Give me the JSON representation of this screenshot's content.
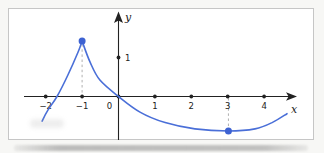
{
  "colors": {
    "curve": "#4a6fd8",
    "point": "#3d62d2",
    "axis": "#222222",
    "dashed_guide": "#b0b0b0",
    "frame_border": "#c6c6c6",
    "background": "#ffffff"
  },
  "chart_data": {
    "type": "line",
    "title": "",
    "xlabel": "x",
    "ylabel": "y",
    "xlim": [
      -2.6,
      4.9
    ],
    "ylim": [
      -1.2,
      2.2
    ],
    "grid": false,
    "legend": false,
    "x_ticks": [
      -2,
      -1,
      0,
      1,
      2,
      3,
      4
    ],
    "x_tick_labels": [
      "−2",
      "−1",
      "0",
      "1",
      "2",
      "3",
      "4"
    ],
    "y_unit_mark": {
      "value": 1,
      "label": "1"
    },
    "series": [
      {
        "name": "left-branch",
        "points": [
          [
            -2.1,
            -0.63
          ],
          [
            -1.94,
            -0.35
          ],
          [
            -1.69,
            0
          ],
          [
            -1.39,
            0.55
          ],
          [
            -1.11,
            1.14
          ],
          [
            -1,
            1.42
          ]
        ]
      },
      {
        "name": "right-branch",
        "points": [
          [
            -1,
            1.42
          ],
          [
            -0.78,
            0.88
          ],
          [
            -0.51,
            0.42
          ],
          [
            0,
            0
          ],
          [
            0.59,
            -0.4
          ],
          [
            1.28,
            -0.67
          ],
          [
            2.1,
            -0.83
          ],
          [
            3.02,
            -0.885
          ],
          [
            3.75,
            -0.83
          ],
          [
            4.22,
            -0.67
          ],
          [
            4.63,
            -0.44
          ]
        ]
      }
    ],
    "annotations": [
      {
        "type": "point",
        "name": "local-max-point",
        "xy": [
          -1,
          1.42
        ],
        "style": "filled-blue"
      },
      {
        "type": "point",
        "name": "local-min-point",
        "xy": [
          3.02,
          -0.885
        ],
        "style": "filled-blue"
      },
      {
        "type": "point",
        "name": "y-unit-point",
        "xy": [
          0,
          1
        ],
        "style": "filled-black",
        "label": "1"
      }
    ],
    "dashed_guides": [
      {
        "name": "guide-x-neg1",
        "from": [
          -1,
          0.1
        ],
        "to": [
          -1,
          1.32
        ]
      },
      {
        "name": "guide-x-3",
        "from": [
          3.02,
          -0.04
        ],
        "to": [
          3.02,
          -0.79
        ]
      }
    ]
  }
}
